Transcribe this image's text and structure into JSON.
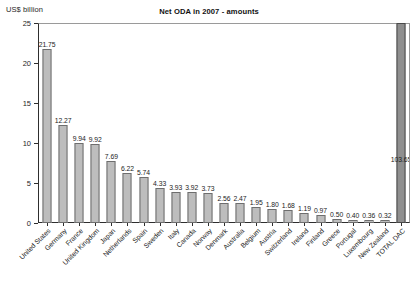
{
  "chart_data": {
    "type": "bar",
    "title": "Net ODA in 2007 - amounts",
    "xlabel": "",
    "ylabel": "US$ billion",
    "ylim": [
      0,
      25
    ],
    "yticks": [
      0,
      5,
      10,
      15,
      20,
      25
    ],
    "ytick_labels": [
      "0",
      "5",
      "10",
      "15",
      "20",
      "25"
    ],
    "grid": false,
    "legend": null,
    "note": "TOTAL DAC bar value 103.65 exceeds the axis maximum and is drawn clipped at the top of the plot frame",
    "categories": [
      "United States",
      "Germany",
      "France",
      "United Kingdom",
      "Japan",
      "Netherlands",
      "Spain",
      "Sweden",
      "Italy",
      "Canada",
      "Norway",
      "Denmark",
      "Australia",
      "Belgium",
      "Austria",
      "Switzerland",
      "Ireland",
      "Finland",
      "Greece",
      "Portugal",
      "Luxembourg",
      "New Zealand",
      "TOTAL DAC"
    ],
    "values": [
      21.75,
      12.27,
      9.94,
      9.92,
      7.69,
      6.22,
      5.74,
      4.33,
      3.93,
      3.92,
      3.73,
      2.56,
      2.47,
      1.95,
      1.8,
      1.68,
      1.19,
      0.97,
      0.5,
      0.4,
      0.36,
      0.32,
      103.65
    ],
    "value_labels": [
      "21.75",
      "12.27",
      "9.94",
      "9.92",
      "7.69",
      "6.22",
      "5.74",
      "4.33",
      "3.93",
      "3.92",
      "3.73",
      "2.56",
      "2.47",
      "1.95",
      "1.80",
      "1.68",
      "1.19",
      "0.97",
      "0.50",
      "0.40",
      "0.36",
      "0.32",
      "103.65"
    ],
    "colors": {
      "bar_fill": "#bdbdbd",
      "bar_border": "#6e6e6e",
      "total_fill": "#8f8f8f",
      "total_border": "#4a4a4a",
      "axis": "#2e2e2e",
      "frame": "#9a9a9a",
      "text": "#1c1c1c",
      "background": "#ffffff"
    }
  }
}
